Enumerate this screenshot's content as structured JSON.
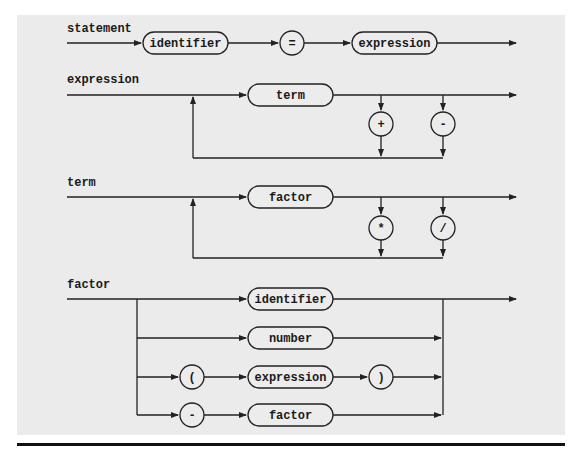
{
  "colors": {
    "panel_background": "#ebebeb",
    "page_background": "#ffffff",
    "line": "#222222",
    "rule": "#111111"
  },
  "rules": {
    "statement": {
      "name": "statement",
      "sequence": [
        "identifier",
        "=",
        "expression"
      ]
    },
    "expression": {
      "name": "expression",
      "main": "term",
      "loop_operators": [
        "+",
        "-"
      ]
    },
    "term": {
      "name": "term",
      "main": "factor",
      "loop_operators": [
        "*",
        "/"
      ]
    },
    "factor": {
      "name": "factor",
      "alternatives": [
        {
          "items": [
            "identifier"
          ]
        },
        {
          "items": [
            "number"
          ]
        },
        {
          "items": [
            "(",
            "expression",
            ")"
          ]
        },
        {
          "items": [
            "-",
            "factor"
          ]
        }
      ]
    }
  },
  "labels": {
    "statement": "statement",
    "expression": "expression",
    "term": "term",
    "factor": "factor"
  },
  "nodes": {
    "stmt_identifier": "identifier",
    "stmt_equals": "=",
    "stmt_expression": "expression",
    "expr_term": "term",
    "expr_plus": "+",
    "expr_minus": "-",
    "term_factor": "factor",
    "term_times": "*",
    "term_divide": "/",
    "factor_identifier": "identifier",
    "factor_number": "number",
    "factor_lparen": "(",
    "factor_expression": "expression",
    "factor_rparen": ")",
    "factor_minus": "-",
    "factor_factor": "factor"
  }
}
